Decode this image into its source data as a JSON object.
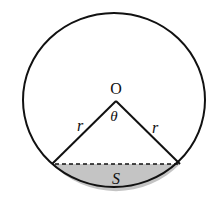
{
  "diagram": {
    "labels": {
      "center": "O",
      "angle": "θ",
      "radius_left": "r",
      "radius_right": "r",
      "segment_area": "S"
    },
    "colors": {
      "stroke": "#111111",
      "segment_fill": "#c4c4c4",
      "background": "#ffffff"
    },
    "geometry": {
      "center": [
        114,
        100
      ],
      "radius": 89,
      "chord_left": [
        52,
        164
      ],
      "chord_right": [
        180,
        164
      ],
      "apex": [
        116,
        101
      ]
    }
  }
}
